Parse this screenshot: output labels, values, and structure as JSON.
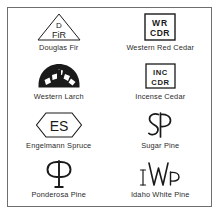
{
  "figure": {
    "name": "lumber-species-grade-stamp-symbols",
    "border_color": "#6e6e6e",
    "ink_color": "#1a1a1a",
    "background": "#ffffff",
    "columns": 2,
    "rows": 4
  },
  "items": [
    {
      "id": "douglas-fir",
      "caption": "Douglas Fir",
      "symbol_name": "triangle-d-fir-stamp",
      "symbol_shape": "triangle",
      "symbol_text_top": "D",
      "symbol_text_bottom": "FIR"
    },
    {
      "id": "western-red-cedar",
      "caption": "Western Red Cedar",
      "symbol_name": "box-wr-cdr-stamp",
      "symbol_shape": "rectangle",
      "symbol_text_top": "WR",
      "symbol_text_bottom": "CDR"
    },
    {
      "id": "western-larch",
      "caption": "Western Larch",
      "symbol_name": "arch-l-stamp",
      "symbol_shape": "semicircle-arch",
      "symbol_text_top": "",
      "symbol_text_bottom": "L"
    },
    {
      "id": "incense-cedar",
      "caption": "Incense Cedar",
      "symbol_name": "box-inc-cdr-stamp",
      "symbol_shape": "rectangle",
      "symbol_text_top": "INC",
      "symbol_text_bottom": "CDR"
    },
    {
      "id": "engelmann-spruce",
      "caption": "Engelmann Spruce",
      "symbol_name": "hexagon-es-stamp",
      "symbol_shape": "hexagon",
      "symbol_text_top": "",
      "symbol_text_bottom": "ES"
    },
    {
      "id": "sugar-pine",
      "caption": "Sugar Pine",
      "symbol_name": "monogram-sp-stamp",
      "symbol_shape": "monogram",
      "symbol_text_top": "",
      "symbol_text_bottom": "SP"
    },
    {
      "id": "ponderosa-pine",
      "caption": "Ponderosa Pine",
      "symbol_name": "monogram-pp-stamp",
      "symbol_shape": "monogram",
      "symbol_text_top": "",
      "symbol_text_bottom": "PP"
    },
    {
      "id": "idaho-white-pine",
      "caption": "Idaho White Pine",
      "symbol_name": "monogram-iwp-stamp",
      "symbol_shape": "monogram",
      "symbol_text_top": "",
      "symbol_text_bottom": "IWP"
    }
  ]
}
